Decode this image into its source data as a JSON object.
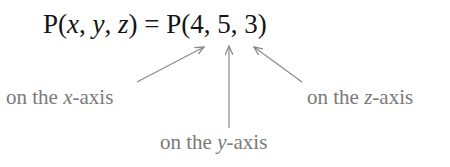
{
  "equation": {
    "lhs_func": "P",
    "lhs_open": "(",
    "var_x": "x",
    "sep1": ", ",
    "var_y": "y",
    "sep2": ", ",
    "var_z": "z",
    "lhs_close": ")",
    "equals": " = ",
    "rhs_func": "P",
    "rhs_open": "(",
    "val_x": "4",
    "rsep1": ", ",
    "val_y": "5",
    "rsep2": ", ",
    "val_z": "3",
    "rhs_close": ")"
  },
  "labels": {
    "x_axis": {
      "prefix": "on the ",
      "var": "x",
      "suffix": "-axis"
    },
    "y_axis": {
      "prefix": "on the ",
      "var": "y",
      "suffix": "-axis"
    },
    "z_axis": {
      "prefix": "on the ",
      "var": "z",
      "suffix": "-axis"
    }
  },
  "colors": {
    "equation": "#141414",
    "label": "#7a7a7a",
    "arrow": "#8a8a8a"
  }
}
